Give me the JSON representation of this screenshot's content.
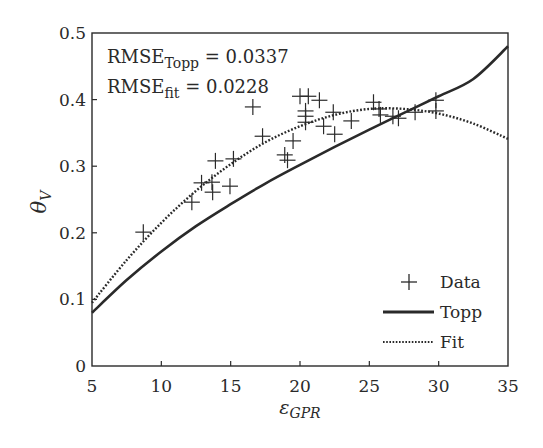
{
  "chart_data": {
    "type": "scatter",
    "title": "",
    "xlabel": "ε_GPR",
    "xlabel_main": "ε",
    "xlabel_sub": "GPR",
    "ylabel": "θ_V",
    "ylabel_main": "θ",
    "ylabel_sub": "V",
    "xlim": [
      5,
      35
    ],
    "ylim": [
      0,
      0.5
    ],
    "xticks": [
      5,
      10,
      15,
      20,
      25,
      30,
      35
    ],
    "xtick_labels": [
      "5",
      "10",
      "15",
      "20",
      "25",
      "30",
      "35"
    ],
    "yticks": [
      0,
      0.1,
      0.2,
      0.3,
      0.4,
      0.5
    ],
    "ytick_labels": [
      "0",
      "0.1",
      "0.2",
      "0.3",
      "0.4",
      "0.5"
    ],
    "grid": false,
    "legend_position": "lower right",
    "annotations": [
      {
        "main": "RMSE",
        "sub": "Topp",
        "rest": " = 0.0337"
      },
      {
        "main": "RMSE",
        "sub": "fit",
        "rest": " = 0.0228"
      }
    ],
    "series": [
      {
        "name": "Data",
        "kind": "markers",
        "marker": "+",
        "points": [
          [
            8.7,
            0.201
          ],
          [
            12.2,
            0.246
          ],
          [
            12.9,
            0.275
          ],
          [
            13.65,
            0.276
          ],
          [
            13.7,
            0.261
          ],
          [
            13.9,
            0.308
          ],
          [
            14.95,
            0.27
          ],
          [
            15.2,
            0.311
          ],
          [
            16.6,
            0.389
          ],
          [
            17.3,
            0.345
          ],
          [
            18.9,
            0.317
          ],
          [
            19.1,
            0.309
          ],
          [
            19.5,
            0.338
          ],
          [
            20.0,
            0.405
          ],
          [
            20.4,
            0.383
          ],
          [
            20.4,
            0.375
          ],
          [
            20.4,
            0.366
          ],
          [
            20.6,
            0.405
          ],
          [
            21.4,
            0.399
          ],
          [
            21.7,
            0.36
          ],
          [
            22.4,
            0.381
          ],
          [
            22.5,
            0.348
          ],
          [
            23.7,
            0.368
          ],
          [
            25.3,
            0.396
          ],
          [
            25.7,
            0.386
          ],
          [
            25.8,
            0.377
          ],
          [
            26.7,
            0.375
          ],
          [
            27.1,
            0.372
          ],
          [
            28.3,
            0.381
          ],
          [
            29.8,
            0.399
          ],
          [
            29.8,
            0.383
          ]
        ]
      },
      {
        "name": "Topp",
        "kind": "line",
        "style": "solid",
        "x": [
          5,
          7.5,
          10,
          12.5,
          15,
          17.5,
          20,
          22.5,
          25,
          27.5,
          30,
          32.5,
          35
        ],
        "values": [
          0.08,
          0.129,
          0.172,
          0.21,
          0.243,
          0.274,
          0.302,
          0.329,
          0.355,
          0.38,
          0.405,
          0.431,
          0.48
        ]
      },
      {
        "name": "Fit",
        "kind": "line",
        "style": "dotted",
        "x": [
          5,
          7.5,
          10,
          12.5,
          15,
          17.5,
          20,
          22.5,
          25,
          27.5,
          30,
          32.5,
          35
        ],
        "values": [
          0.095,
          0.159,
          0.215,
          0.263,
          0.303,
          0.336,
          0.36,
          0.377,
          0.386,
          0.386,
          0.379,
          0.364,
          0.341
        ]
      }
    ]
  },
  "legend": {
    "items": [
      {
        "label": "Data",
        "symbol": "+"
      },
      {
        "label": "Topp",
        "symbol": "solid-line"
      },
      {
        "label": "Fit",
        "symbol": "dotted-line"
      }
    ]
  },
  "colors": {
    "ink": "#2a2a2a",
    "background": "#ffffff"
  }
}
